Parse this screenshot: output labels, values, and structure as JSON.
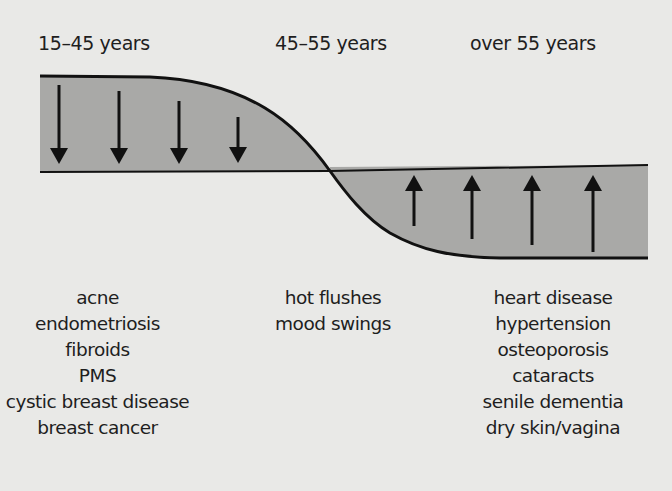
{
  "diagram": {
    "stages": [
      {
        "label": "15–45 years",
        "trend": "decrease",
        "conditions": [
          "acne",
          "endometriosis",
          "fibroids",
          "PMS",
          "cystic breast disease",
          "breast cancer"
        ]
      },
      {
        "label": "45–55 years",
        "trend": "transition",
        "conditions": [
          "hot flushes",
          "mood swings"
        ]
      },
      {
        "label": "over 55 years",
        "trend": "increase",
        "conditions": [
          "heart disease",
          "hypertension",
          "osteoporosis",
          "cataracts",
          "senile dementia",
          "dry skin/vagina"
        ]
      }
    ],
    "down_arrow_count": 4,
    "up_arrow_count": 4,
    "colors": {
      "background": "#e9e9e7",
      "fill": "#a9a9a7",
      "line": "#111111"
    }
  }
}
